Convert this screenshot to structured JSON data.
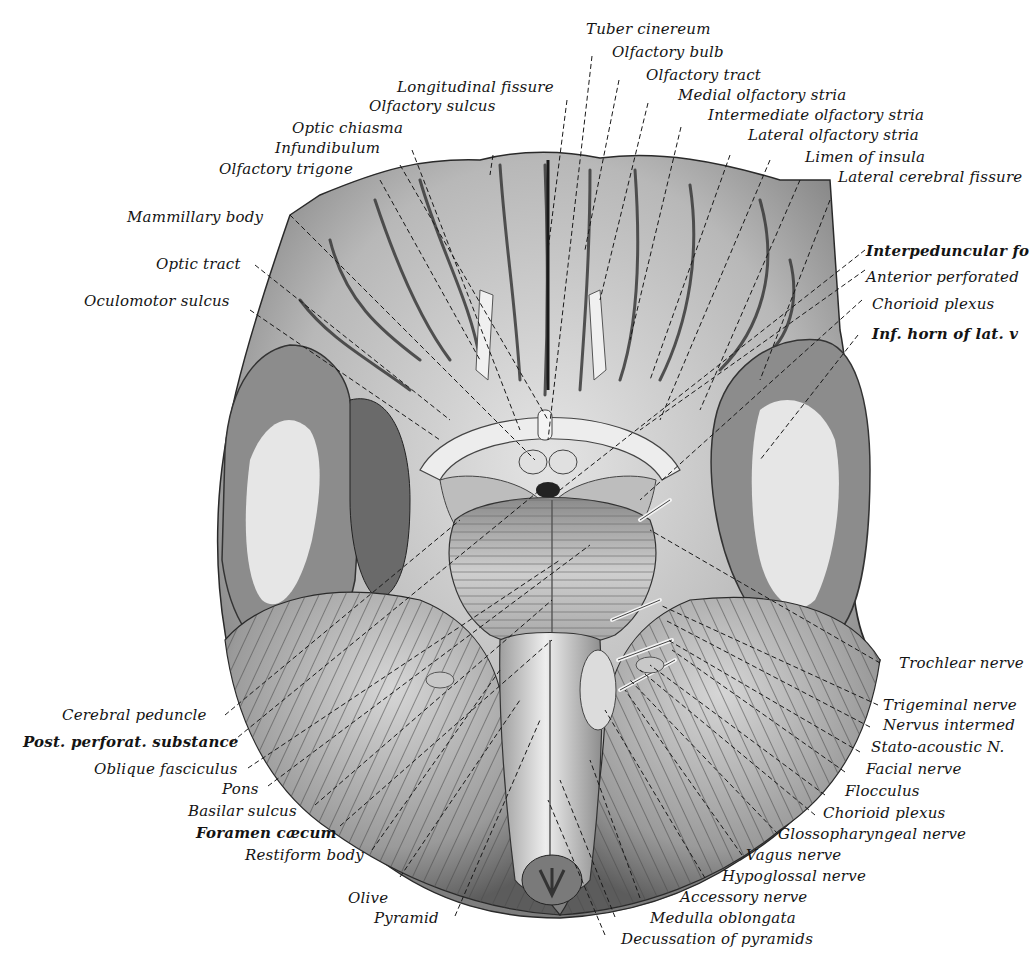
{
  "figure": {
    "colors": {
      "background": "#ffffff",
      "ink": "#141414",
      "gyri_light": "#d9d9d9",
      "gyri_mid": "#9a9a9a",
      "sulci_dark": "#3a3a3a",
      "white_matter": "#e6e6e6",
      "grey_matter": "#8a8a8a"
    }
  },
  "labels": {
    "top": [
      {
        "id": "tuber-cinereum",
        "text": "Tuber cinereum"
      },
      {
        "id": "olfactory-bulb",
        "text": "Olfactory bulb"
      },
      {
        "id": "olfactory-tract",
        "text": "Olfactory tract"
      },
      {
        "id": "longitudinal-fissure",
        "text": "Longitudinal fissure"
      },
      {
        "id": "medial-olfactory-stria",
        "text": "Medial olfactory stria"
      },
      {
        "id": "olfactory-sulcus",
        "text": "Olfactory sulcus"
      },
      {
        "id": "intermediate-olfactory-stria",
        "text": "Intermediate olfactory stria"
      },
      {
        "id": "optic-chiasma",
        "text": "Optic chiasma"
      },
      {
        "id": "lateral-olfactory-stria",
        "text": "Lateral olfactory stria"
      },
      {
        "id": "infundibulum",
        "text": "Infundibulum"
      },
      {
        "id": "limen-of-insula",
        "text": "Limen of insula"
      },
      {
        "id": "olfactory-trigone",
        "text": "Olfactory trigone"
      },
      {
        "id": "lateral-cerebral-fissure",
        "text": "Lateral cerebral fissure"
      }
    ],
    "left": [
      {
        "id": "mammillary-body",
        "text": "Mammillary body"
      },
      {
        "id": "optic-tract",
        "text": "Optic tract"
      },
      {
        "id": "oculomotor-sulcus",
        "text": "Oculomotor sulcus"
      },
      {
        "id": "cerebral-peduncle",
        "text": "Cerebral peduncle"
      },
      {
        "id": "post-perforat-substance",
        "text": "Post. perforat. substance"
      },
      {
        "id": "oblique-fasciculus",
        "text": "Oblique fasciculus"
      },
      {
        "id": "pons",
        "text": "Pons"
      },
      {
        "id": "basilar-sulcus",
        "text": "Basilar sulcus"
      },
      {
        "id": "foramen-caecum",
        "text": "Foramen cæcum"
      },
      {
        "id": "restiform-body",
        "text": "Restiform body"
      },
      {
        "id": "olive",
        "text": "Olive"
      },
      {
        "id": "pyramid",
        "text": "Pyramid"
      }
    ],
    "right": [
      {
        "id": "interpeduncular-fossa",
        "text": "Interpeduncular fo"
      },
      {
        "id": "anterior-perforated",
        "text": "Anterior perforated"
      },
      {
        "id": "chorioid-plexus-upper",
        "text": "Chorioid plexus"
      },
      {
        "id": "inf-horn-lat-v",
        "text": "Inf. horn of lat. v"
      },
      {
        "id": "trochlear-nerve",
        "text": "Trochlear nerve"
      },
      {
        "id": "trigeminal-nerve",
        "text": "Trigeminal nerve"
      },
      {
        "id": "nervus-intermedius",
        "text": "Nervus intermed"
      },
      {
        "id": "stato-acoustic-n",
        "text": "Stato-acoustic N."
      },
      {
        "id": "facial-nerve",
        "text": "Facial nerve"
      },
      {
        "id": "flocculus",
        "text": "Flocculus"
      },
      {
        "id": "chorioid-plexus-lower",
        "text": "Chorioid plexus"
      },
      {
        "id": "glossopharyngeal-nerve",
        "text": "Glossopharyngeal nerve"
      },
      {
        "id": "vagus-nerve",
        "text": "Vagus nerve"
      },
      {
        "id": "hypoglossal-nerve",
        "text": "Hypoglossal nerve"
      },
      {
        "id": "accessory-nerve",
        "text": "Accessory nerve"
      },
      {
        "id": "medulla-oblongata",
        "text": "Medulla oblongata"
      },
      {
        "id": "decussation-of-pyramids",
        "text": "Decussation of pyramids"
      }
    ]
  }
}
